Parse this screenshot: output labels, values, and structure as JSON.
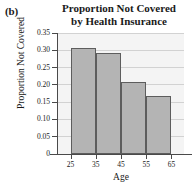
{
  "panel": {
    "label": "(b)"
  },
  "title": {
    "line1": "Proportion Not Covered",
    "line2": "by Health Insurance",
    "full": "Proportion Not Covered by Health Insurance"
  },
  "axes": {
    "ylabel": "Proportion Not Covered",
    "xlabel": "Age",
    "yticks": [
      "0",
      "0.05",
      "0.10",
      "0.15",
      "0.20",
      "0.25",
      "0.30",
      "0.35"
    ],
    "ytick_values": [
      0,
      0.05,
      0.1,
      0.15,
      0.2,
      0.25,
      0.3,
      0.35
    ],
    "xticks": [
      "25",
      "35",
      "45",
      "55",
      "65"
    ],
    "xtick_values": [
      25,
      35,
      45,
      55,
      65
    ]
  },
  "chart_data": {
    "type": "bar",
    "title": "Proportion Not Covered by Health Insurance",
    "panel_label": "(b)",
    "xlabel": "Age",
    "ylabel": "Proportion Not Covered",
    "categories": [
      "25-35",
      "35-45",
      "45-55",
      "55-65"
    ],
    "bin_edges": [
      25,
      35,
      45,
      55,
      65
    ],
    "values": [
      0.307,
      0.292,
      0.208,
      0.168
    ],
    "ylim": [
      0,
      0.35
    ],
    "xlim": [
      20,
      70
    ],
    "grid": "horizontal",
    "legend": "none",
    "bar_fill": "#b4b4b4",
    "bar_edge": "#5d5d5d",
    "plot_background": "#f4f4f4"
  }
}
